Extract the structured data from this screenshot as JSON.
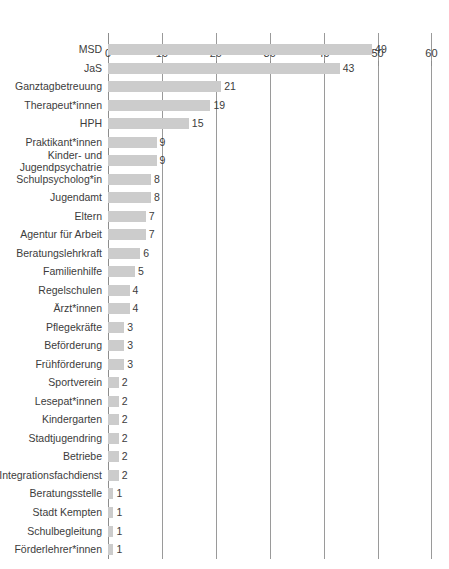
{
  "chart_data": {
    "type": "bar",
    "orientation": "horizontal",
    "title": "",
    "subtitle": "",
    "xlabel": "",
    "ylabel": "",
    "xlim": [
      0,
      70
    ],
    "xticks": [
      0,
      10,
      20,
      30,
      40,
      50,
      60,
      70
    ],
    "grid": true,
    "legend": null,
    "bar_color": "#cccccc",
    "axis_color": "#8d8d8d",
    "text_color": "#3c3c3c",
    "categories": [
      "MSD",
      "JaS",
      "Ganztagbetreuung",
      "Therapeut*innen",
      "HPH",
      "Praktikant*innen",
      "Kinder- und\nJugendpsychatrie",
      "Schulpsycholog*in",
      "Jugendamt",
      "Eltern",
      "Agentur für Arbeit",
      "Beratungslehrkraft",
      "Familienhilfe",
      "Regelschulen",
      "Ärzt*innen",
      "Pflegekräfte",
      "Beförderung",
      "Frühförderung",
      "Sportverein",
      "Lesepat*innen",
      "Kindergarten",
      "Stadtjugendring",
      "Betriebe",
      "Integrationsfachdienst",
      "Beratungsstelle",
      "Stadt Kempten",
      "Schulbegleitung",
      "Förderlehrer*innen"
    ],
    "values": [
      49,
      43,
      21,
      19,
      15,
      9,
      9,
      8,
      8,
      7,
      7,
      6,
      5,
      4,
      4,
      3,
      3,
      3,
      2,
      2,
      2,
      2,
      2,
      2,
      1,
      1,
      1,
      1
    ],
    "value_labels": [
      "49",
      "43",
      "21",
      "19",
      "15",
      "9",
      "9",
      "8",
      "8",
      "7",
      "7",
      "6",
      "5",
      "4",
      "4",
      "3",
      "3",
      "3",
      "2",
      "2",
      "2",
      "2",
      "2",
      "2",
      "1",
      "1",
      "1",
      "1"
    ]
  }
}
